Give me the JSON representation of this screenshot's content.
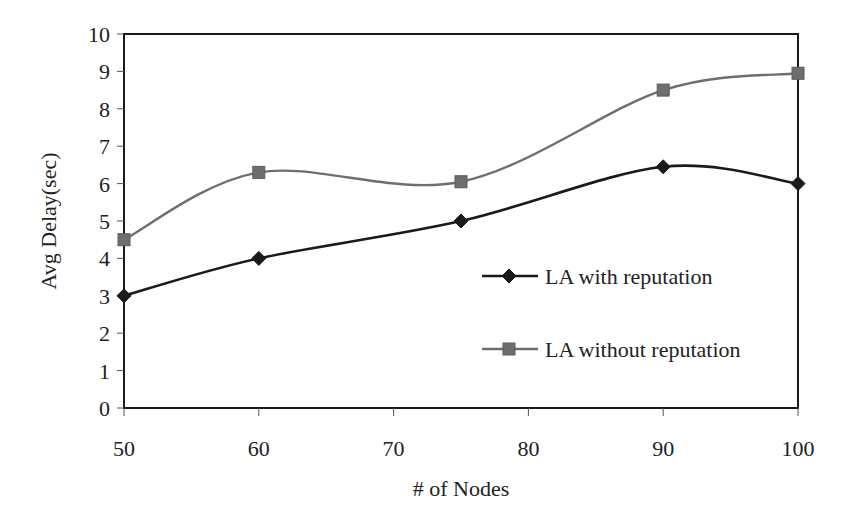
{
  "chart_data": {
    "type": "line",
    "title": "",
    "xlabel": "# of Nodes",
    "ylabel": "Avg Delay(sec)",
    "xlim": [
      50,
      100
    ],
    "ylim": [
      0,
      10
    ],
    "x_ticks": [
      50,
      60,
      70,
      80,
      90,
      100
    ],
    "y_ticks": [
      0,
      1,
      2,
      3,
      4,
      5,
      6,
      7,
      8,
      9,
      10
    ],
    "grid": false,
    "legend_position": "inside-right",
    "x": [
      50,
      60,
      75,
      90,
      100
    ],
    "series": [
      {
        "name": "LA with reputation",
        "marker": "diamond",
        "color": "#1a1a1a",
        "values": [
          3.0,
          4.0,
          5.0,
          6.45,
          6.0
        ]
      },
      {
        "name": "LA without reputation",
        "marker": "square",
        "color": "#6e6e6e",
        "values": [
          4.5,
          6.3,
          6.05,
          8.5,
          8.95
        ]
      }
    ]
  }
}
